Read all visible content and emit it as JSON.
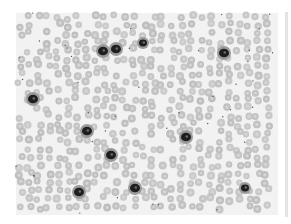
{
  "image": {
    "subject": "blood smear micrograph",
    "palette": {
      "background": "#ffffff",
      "smear": "#f2f2f2",
      "rbc_fill": "#bdbdbd",
      "rbc_center": "#d6d6d6",
      "wbc": "#1e1e1e"
    },
    "smear_region": {
      "x": 16,
      "y": 13,
      "w": 262,
      "h": 202
    },
    "leukocytes": [
      {
        "x": 103,
        "y": 51,
        "r": 5
      },
      {
        "x": 116,
        "y": 49,
        "r": 5
      },
      {
        "x": 143,
        "y": 43,
        "r": 4
      },
      {
        "x": 224,
        "y": 53,
        "r": 5
      },
      {
        "x": 33,
        "y": 99,
        "r": 5
      },
      {
        "x": 87,
        "y": 131,
        "r": 5
      },
      {
        "x": 186,
        "y": 137,
        "r": 5
      },
      {
        "x": 111,
        "y": 155,
        "r": 5
      },
      {
        "x": 79,
        "y": 192,
        "r": 5
      },
      {
        "x": 135,
        "y": 188,
        "r": 5
      },
      {
        "x": 245,
        "y": 188,
        "r": 4
      }
    ]
  }
}
